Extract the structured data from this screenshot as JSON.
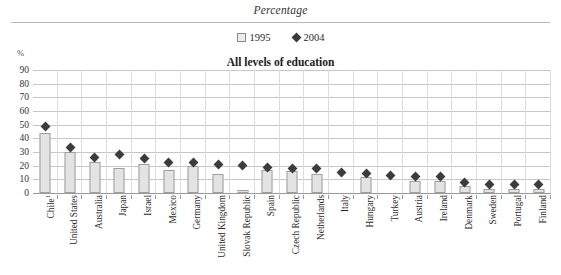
{
  "header": {
    "title": "Percentage"
  },
  "legend": [
    {
      "label": "1995",
      "marker": "hollow-square-icon",
      "color": "#ececec"
    },
    {
      "label": "2004",
      "marker": "filled-diamond-icon",
      "color": "#3a3a3a"
    }
  ],
  "axis": {
    "unit_label": "%"
  },
  "chart_data": {
    "type": "bar",
    "title": "All levels of education",
    "subtitle": "All levels of education",
    "xlabel": "",
    "ylabel": "%",
    "ylim": [
      0,
      90
    ],
    "ytick_step": 10,
    "yticks": [
      90,
      80,
      70,
      60,
      50,
      40,
      30,
      20,
      10,
      0
    ],
    "grid": true,
    "legend_position": "top-center",
    "categories": [
      "Chile¹",
      "United States",
      "Australia",
      "Japan",
      "Israel",
      "Mexico",
      "Germany",
      "United Kingdom",
      "Slovak Republic",
      "Spain",
      "Czech Republic",
      "Netherlands",
      "Italy",
      "Hungary",
      "Turkey",
      "Austria",
      "Ireland",
      "Denmark",
      "Sweden",
      "Portugal",
      "Finland"
    ],
    "series": [
      {
        "name": "1995",
        "type": "bar",
        "values": [
          44,
          30,
          23,
          18,
          21,
          17,
          20,
          14,
          2,
          17,
          16,
          14,
          0,
          12,
          0,
          9,
          9,
          5,
          3,
          3,
          3
        ]
      },
      {
        "name": "2004",
        "type": "scatter",
        "values": [
          49,
          33,
          26,
          28,
          25,
          22,
          22,
          21,
          20,
          19,
          18,
          18,
          15,
          14,
          13,
          12,
          12,
          8,
          6,
          6,
          6
        ]
      }
    ]
  }
}
